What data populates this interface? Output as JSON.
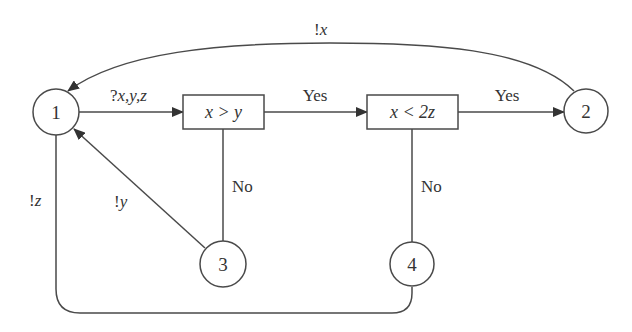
{
  "diagram": {
    "colors": {
      "stroke": "#4a4a4a",
      "text": "#333333",
      "background": "#ffffff"
    },
    "nodes": {
      "n1": {
        "label": "1",
        "shape": "circle"
      },
      "n2": {
        "label": "2",
        "shape": "circle"
      },
      "n3": {
        "label": "3",
        "shape": "circle"
      },
      "n4": {
        "label": "4",
        "shape": "circle"
      },
      "cond1": {
        "label": "x > y",
        "shape": "box"
      },
      "cond2": {
        "label": "x < 2z",
        "shape": "box"
      }
    },
    "edges": {
      "n1_to_cond1": {
        "from": "1",
        "to": "x > y",
        "label_prefix": "?",
        "label_vars": "x,y,z"
      },
      "cond1_to_cond2": {
        "from": "x > y",
        "to": "x < 2z",
        "label": "Yes"
      },
      "cond2_to_n2": {
        "from": "x < 2z",
        "to": "2",
        "label": "Yes"
      },
      "n2_to_n1": {
        "from": "2",
        "to": "1",
        "label_prefix": "!",
        "label_var": "x"
      },
      "cond1_to_n3": {
        "from": "x > y",
        "to": "3",
        "label": "No"
      },
      "cond2_to_n4": {
        "from": "x < 2z",
        "to": "4",
        "label": "No"
      },
      "n3_to_n1": {
        "from": "3",
        "to": "1",
        "label_prefix": "!",
        "label_var": "y"
      },
      "n4_to_n1": {
        "from": "4",
        "to": "1",
        "label_prefix": "!",
        "label_var": "z"
      }
    }
  }
}
